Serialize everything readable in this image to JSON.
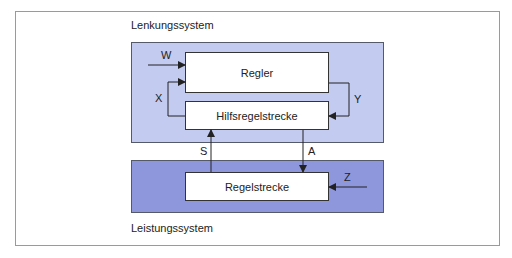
{
  "colors": {
    "lenkung_fill": "#c4cbf0",
    "leistung_fill": "#8e97db",
    "box_fill": "#ffffff",
    "line": "#222222"
  },
  "systems": {
    "lenkung": {
      "label": "Lenkungssystem"
    },
    "leistung": {
      "label": "Leistungssystem"
    }
  },
  "blocks": {
    "regler": "Regler",
    "hilfsregelstrecke": "Hilfsregelstrecke",
    "regelstrecke": "Regelstrecke"
  },
  "signals": {
    "w": "W",
    "x": "X",
    "y": "Y",
    "s": "S",
    "a": "A",
    "z": "Z"
  }
}
